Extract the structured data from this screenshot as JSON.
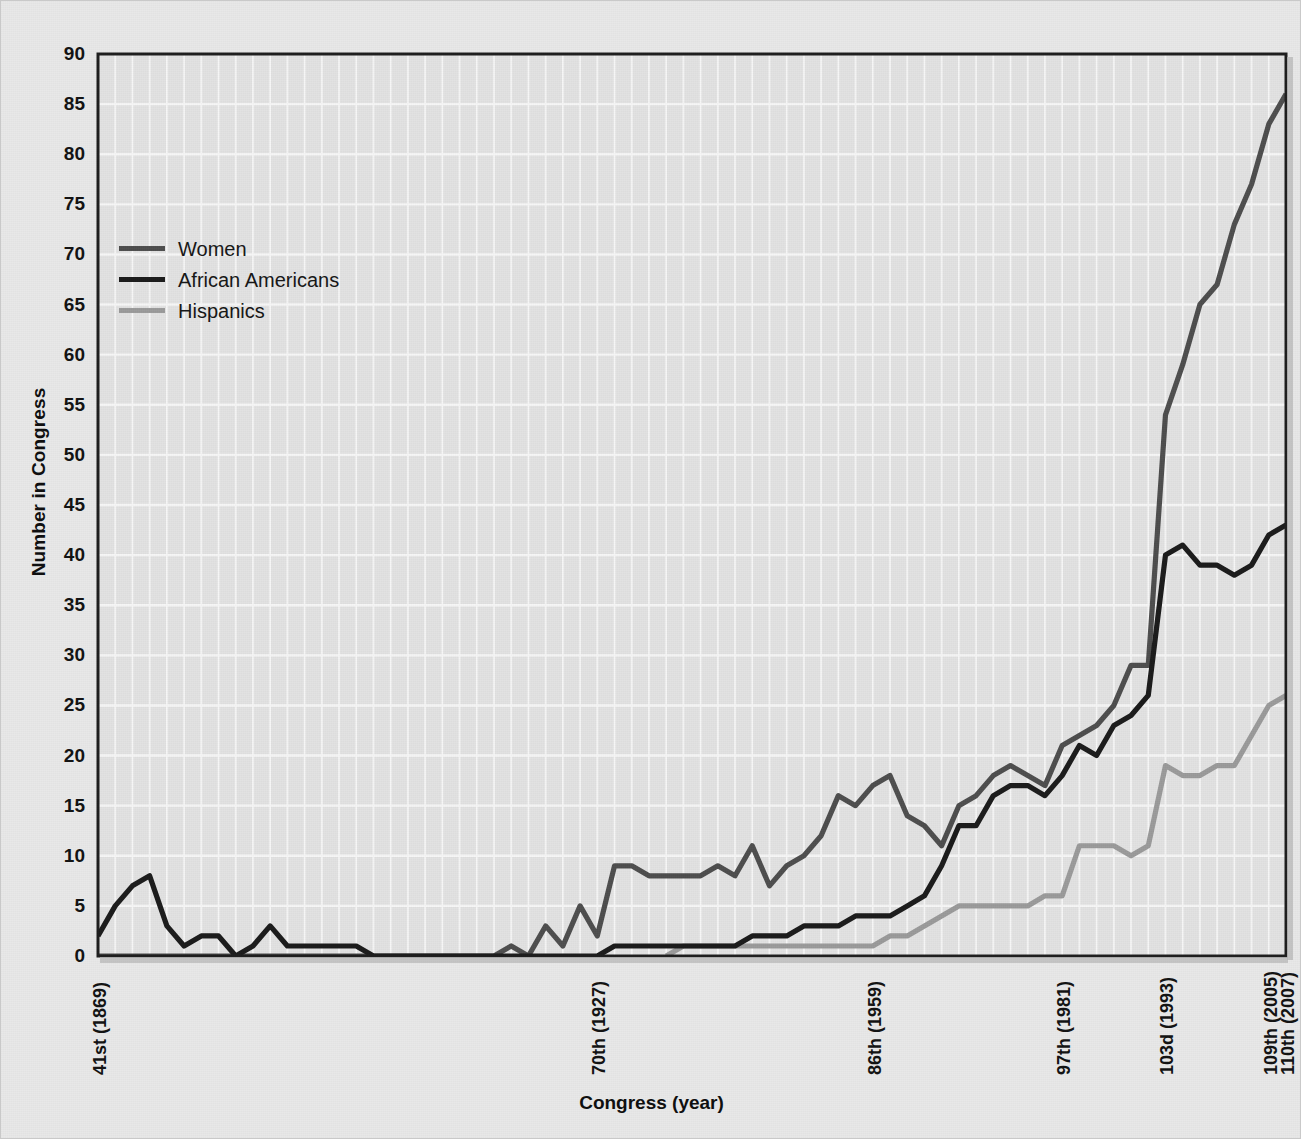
{
  "chart_data": {
    "type": "line",
    "title": "",
    "xlabel": "Congress (year)",
    "ylabel": "Number in Congress",
    "ylim": [
      0,
      90
    ],
    "ytick_step": 5,
    "yticks": [
      0,
      5,
      10,
      15,
      20,
      25,
      30,
      35,
      40,
      45,
      50,
      55,
      60,
      65,
      70,
      75,
      80,
      85,
      90
    ],
    "grid": true,
    "legend_position": "upper-left",
    "x_axis_note": "One point per Congress, 41st (1869) through 110th (2007); 70 Congresses.",
    "xtick_labels": [
      {
        "label": "41st (1869)",
        "index": 0
      },
      {
        "label": "70th (1927)",
        "index": 29
      },
      {
        "label": "86th (1959)",
        "index": 45
      },
      {
        "label": "97th (1981)",
        "index": 56
      },
      {
        "label": "103d (1993)",
        "index": 62
      },
      {
        "label": "109th (2005)",
        "index": 68
      },
      {
        "label": "110th (2007)",
        "index": 69
      }
    ],
    "x_congress_numbers": [
      41,
      42,
      43,
      44,
      45,
      46,
      47,
      48,
      49,
      50,
      51,
      52,
      53,
      54,
      55,
      56,
      57,
      58,
      59,
      60,
      61,
      62,
      63,
      64,
      65,
      66,
      67,
      68,
      69,
      70,
      71,
      72,
      73,
      74,
      75,
      76,
      77,
      78,
      79,
      80,
      81,
      82,
      83,
      84,
      85,
      86,
      87,
      88,
      89,
      90,
      91,
      92,
      93,
      94,
      95,
      96,
      97,
      98,
      99,
      100,
      101,
      102,
      103,
      104,
      105,
      106,
      107,
      108,
      109,
      110
    ],
    "series": [
      {
        "name": "Women",
        "color": "#4d4d4d",
        "values": [
          0,
          0,
          0,
          0,
          0,
          0,
          0,
          0,
          0,
          0,
          0,
          0,
          0,
          0,
          0,
          0,
          0,
          0,
          0,
          0,
          0,
          0,
          0,
          0,
          1,
          0,
          3,
          1,
          5,
          2,
          9,
          9,
          8,
          8,
          8,
          8,
          9,
          8,
          11,
          7,
          9,
          10,
          12,
          16,
          15,
          17,
          18,
          14,
          13,
          11,
          15,
          16,
          18,
          19,
          18,
          17,
          21,
          22,
          23,
          25,
          29,
          29,
          54,
          59,
          65,
          67,
          73,
          77,
          83,
          86
        ]
      },
      {
        "name": "African Americans",
        "color": "#1a1a1a",
        "values": [
          2,
          5,
          7,
          8,
          3,
          1,
          2,
          2,
          0,
          1,
          3,
          1,
          1,
          1,
          1,
          1,
          0,
          0,
          0,
          0,
          0,
          0,
          0,
          0,
          0,
          0,
          0,
          0,
          0,
          0,
          1,
          1,
          1,
          1,
          1,
          1,
          1,
          1,
          2,
          2,
          2,
          3,
          3,
          3,
          4,
          4,
          4,
          5,
          6,
          9,
          13,
          13,
          16,
          17,
          17,
          16,
          18,
          21,
          20,
          23,
          24,
          26,
          40,
          41,
          39,
          39,
          38,
          39,
          42,
          43
        ]
      },
      {
        "name": "Hispanics",
        "color": "#9a9a9a",
        "values": [
          0,
          0,
          0,
          0,
          0,
          0,
          0,
          0,
          0,
          0,
          0,
          0,
          0,
          0,
          0,
          0,
          0,
          0,
          0,
          0,
          0,
          0,
          0,
          0,
          0,
          0,
          0,
          0,
          0,
          0,
          0,
          0,
          0,
          0,
          1,
          1,
          1,
          1,
          1,
          1,
          1,
          1,
          1,
          1,
          1,
          1,
          2,
          2,
          3,
          4,
          5,
          5,
          5,
          5,
          5,
          6,
          6,
          11,
          11,
          11,
          10,
          11,
          19,
          18,
          18,
          19,
          19,
          22,
          25,
          26
        ]
      }
    ],
    "series_notes": {
      "Women": "rises to 86 in the 110th Congress (2007)",
      "African Americans": "peaks near 43 in the 110th Congress",
      "Hispanics": "reaches about 26 in the 110th Congress"
    }
  },
  "axes": {
    "y_title": "Number in Congress",
    "x_title": "Congress (year)"
  },
  "legend": {
    "items": [
      {
        "label": "Women",
        "color": "#4d4d4d"
      },
      {
        "label": "African Americans",
        "color": "#1a1a1a"
      },
      {
        "label": "Hispanics",
        "color": "#9a9a9a"
      }
    ]
  },
  "colors": {
    "page_background": "#e8e8e8",
    "plot_background": "#e2e2e2",
    "gridline": "#f6f6f6",
    "axis": "#1c1c1c",
    "text": "#111111"
  }
}
